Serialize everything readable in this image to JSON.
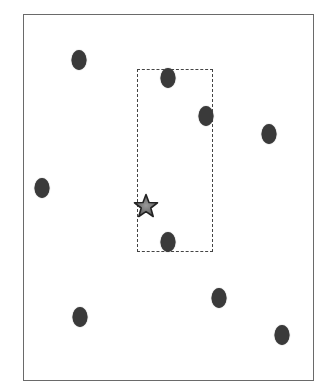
{
  "diagram": {
    "frame": {
      "left": 23,
      "top": 14,
      "right": 314,
      "bottom": 381,
      "color": "#6a6a6a"
    },
    "query_rect": {
      "left": 137,
      "top": 69,
      "right": 213,
      "bottom": 252,
      "style": "dashed",
      "color": "#444444"
    },
    "points": [
      {
        "x": 79,
        "y": 60
      },
      {
        "x": 168,
        "y": 78
      },
      {
        "x": 206,
        "y": 116
      },
      {
        "x": 269,
        "y": 134
      },
      {
        "x": 42,
        "y": 188
      },
      {
        "x": 168,
        "y": 242
      },
      {
        "x": 219,
        "y": 298
      },
      {
        "x": 80,
        "y": 317
      },
      {
        "x": 282,
        "y": 335
      }
    ],
    "query_point": {
      "x": 146,
      "y": 206,
      "shape": "star",
      "fill": "#7a7a7a",
      "stroke": "#222222"
    },
    "point_color": "#3a3a3a"
  }
}
